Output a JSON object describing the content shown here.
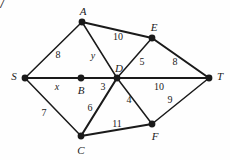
{
  "figure": {
    "corner_number": "7",
    "type": "weighted-graph-diagram",
    "background_color": "#fefefe",
    "line_color": "#1a1a1a",
    "text_color": "#222222"
  },
  "nodes": [
    {
      "id": "S",
      "label": "S",
      "x": 25,
      "y": 78,
      "label_x": 14,
      "label_y": 76
    },
    {
      "id": "A",
      "label": "A",
      "x": 82,
      "y": 22,
      "label_x": 83,
      "label_y": 11
    },
    {
      "id": "B",
      "label": "B",
      "x": 81,
      "y": 78,
      "label_x": 81,
      "label_y": 90
    },
    {
      "id": "C",
      "label": "C",
      "x": 81,
      "y": 136,
      "label_x": 81,
      "label_y": 150
    },
    {
      "id": "D",
      "label": "D",
      "x": 117,
      "y": 78,
      "label_x": 119,
      "label_y": 68
    },
    {
      "id": "E",
      "label": "E",
      "x": 152,
      "y": 38,
      "label_x": 154,
      "label_y": 27
    },
    {
      "id": "F",
      "label": "F",
      "x": 152,
      "y": 124,
      "label_x": 155,
      "label_y": 136
    },
    {
      "id": "T",
      "label": "T",
      "x": 209,
      "y": 78,
      "label_x": 220,
      "label_y": 76
    }
  ],
  "edges": [
    {
      "from": "S",
      "to": "A",
      "weight": "8",
      "label_x": 58,
      "label_y": 55,
      "style": "thin"
    },
    {
      "from": "S",
      "to": "D",
      "weight": "x",
      "label_x": 57,
      "label_y": 87,
      "style": "thick",
      "via": "B",
      "italic": true
    },
    {
      "from": "S",
      "to": "C",
      "weight": "7",
      "label_x": 44,
      "label_y": 113,
      "style": "thin"
    },
    {
      "from": "A",
      "to": "D",
      "weight": "y",
      "label_x": 93,
      "label_y": 56,
      "style": "thin",
      "italic": true
    },
    {
      "from": "A",
      "to": "E",
      "weight": "10",
      "label_x": 118,
      "label_y": 37,
      "style": "thick"
    },
    {
      "from": "E",
      "to": "D",
      "weight": "5",
      "label_x": 142,
      "label_y": 62,
      "style": "thin"
    },
    {
      "from": "E",
      "to": "T",
      "weight": "8",
      "label_x": 175,
      "label_y": 62,
      "style": "thick"
    },
    {
      "from": "C",
      "to": "D",
      "weight": "6",
      "label_x": 90,
      "label_y": 108,
      "style": "thick"
    },
    {
      "from": "D",
      "to": "T",
      "weight": "10",
      "label_x": 159,
      "label_y": 87,
      "style": "thick"
    },
    {
      "from": "D",
      "to": "F",
      "weight": "4",
      "label_x": 129,
      "label_y": 100,
      "style": "thin"
    },
    {
      "from": "C",
      "to": "F",
      "weight": "11",
      "label_x": 117,
      "label_y": 124,
      "style": "thick"
    },
    {
      "from": "F",
      "to": "T",
      "weight": "9",
      "label_x": 170,
      "label_y": 100,
      "style": "thin"
    }
  ],
  "extra_labels": [
    {
      "name": "weight-label-3",
      "text": "3",
      "x": 103,
      "y": 87
    }
  ]
}
